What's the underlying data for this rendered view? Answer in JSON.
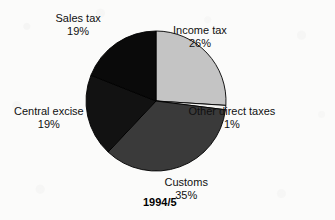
{
  "caption": "1994/5",
  "chart_data": {
    "type": "pie",
    "title": "",
    "subtitle": "",
    "caption": "1994/5",
    "xlabel": "",
    "ylabel": "",
    "legend_position": "none",
    "grid": false,
    "units": "percent",
    "start_angle_deg": 0,
    "direction": "clockwise",
    "categories": [
      "Income tax",
      "Other direct taxes",
      "Customs",
      "Central excise",
      "Sales tax"
    ],
    "values": [
      26,
      1,
      35,
      19,
      19
    ],
    "slices": [
      {
        "label": "Income tax",
        "percent_label": "26%",
        "value": 26,
        "color": "#c4c4c4",
        "start_deg": 0,
        "end_deg": 93.6,
        "label_x": 200,
        "label_y": 24,
        "label_align": "ctr"
      },
      {
        "label": "Other direct taxes",
        "percent_label": "1%",
        "value": 1,
        "color": "#f2f2f0",
        "start_deg": 93.6,
        "end_deg": 97.2,
        "label_x": 232,
        "label_y": 105,
        "label_align": "ctr"
      },
      {
        "label": "Customs",
        "percent_label": "35%",
        "value": 35,
        "color": "#3a3a3a",
        "start_deg": 97.2,
        "end_deg": 223.2,
        "label_x": 186,
        "label_y": 176,
        "label_align": "ctr"
      },
      {
        "label": "Central excise",
        "percent_label": "19%",
        "value": 19,
        "color": "#121212",
        "start_deg": 223.2,
        "end_deg": 291.6,
        "label_x": 14,
        "label_y": 105,
        "label_align": "lft"
      },
      {
        "label": "Sales tax",
        "percent_label": "19%",
        "value": 19,
        "color": "#0a0a0a",
        "start_deg": 291.6,
        "end_deg": 360,
        "label_x": 78,
        "label_y": 12,
        "label_align": "ctr"
      }
    ],
    "geometry": {
      "center_x": 156,
      "center_y": 101,
      "radius": 70
    }
  }
}
